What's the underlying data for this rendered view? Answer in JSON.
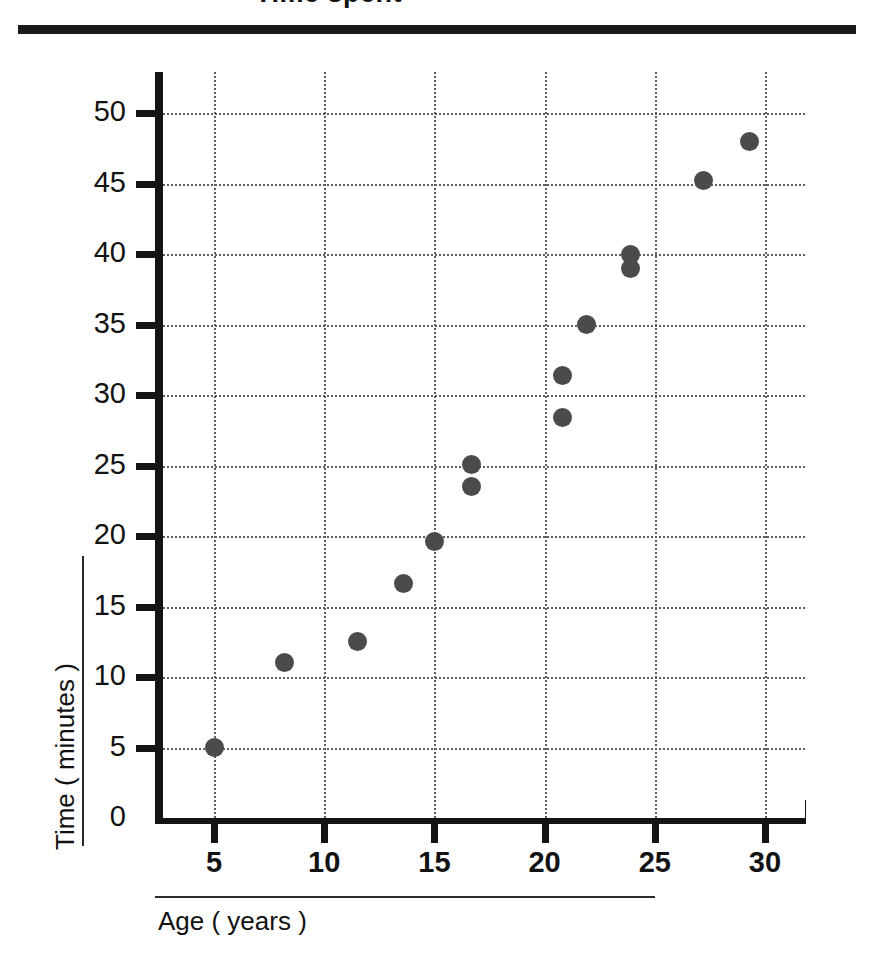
{
  "title": {
    "text": "Time spent",
    "cropped": true
  },
  "chart_data": {
    "type": "scatter",
    "title": "",
    "xlabel": "Age ( years )",
    "ylabel": "Time ( minutes )",
    "xlim": [
      2.5,
      32
    ],
    "ylim": [
      0,
      52
    ],
    "xticks": [
      5,
      10,
      15,
      20,
      25,
      30
    ],
    "yticks": [
      0,
      5,
      10,
      15,
      20,
      25,
      30,
      35,
      40,
      45,
      50
    ],
    "grid": true,
    "legend": "none",
    "marker_color": "#4b4b4b",
    "points": [
      {
        "x": 5.0,
        "y": 5.0
      },
      {
        "x": 8.2,
        "y": 11.0
      },
      {
        "x": 11.5,
        "y": 12.5
      },
      {
        "x": 13.6,
        "y": 16.6
      },
      {
        "x": 15.0,
        "y": 19.6
      },
      {
        "x": 16.7,
        "y": 25.1
      },
      {
        "x": 16.7,
        "y": 23.5
      },
      {
        "x": 20.8,
        "y": 31.4
      },
      {
        "x": 20.8,
        "y": 28.4
      },
      {
        "x": 21.9,
        "y": 35.0
      },
      {
        "x": 23.9,
        "y": 40.0
      },
      {
        "x": 23.9,
        "y": 39.0
      },
      {
        "x": 27.2,
        "y": 45.2
      },
      {
        "x": 29.3,
        "y": 48.0
      }
    ]
  },
  "axes": {
    "x_tick_labels": [
      "5",
      "10",
      "15",
      "20",
      "25",
      "30"
    ],
    "y_tick_labels": [
      "0",
      "5",
      "10",
      "15",
      "20",
      "25",
      "30",
      "35",
      "40",
      "45",
      "50"
    ],
    "x_title": "Age ( years )",
    "y_title": "Time ( minutes )"
  }
}
